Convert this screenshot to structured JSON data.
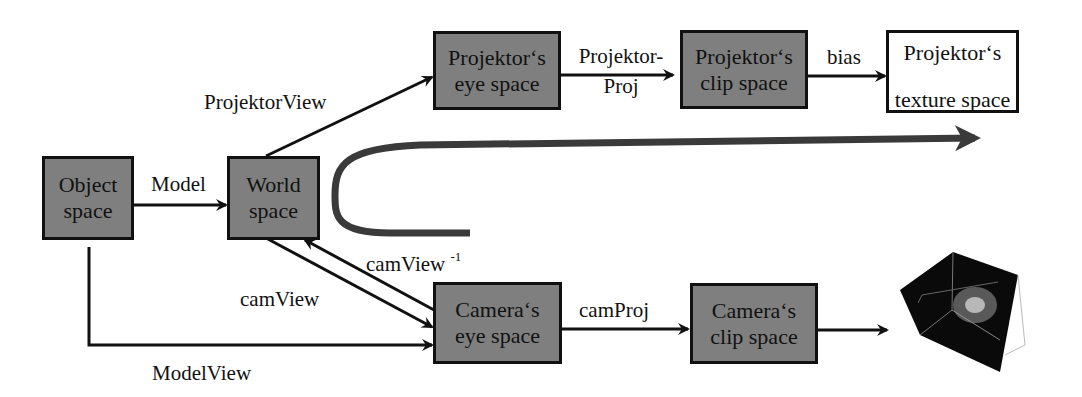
{
  "diagram": {
    "title": "",
    "colors": {
      "box_fill": "#7f7f7f",
      "box_border": "#111111",
      "white_box_fill": "#ffffff",
      "flow_arrow": "#3a3a3a",
      "background": "#ffffff"
    },
    "nodes": {
      "object_space": {
        "line1": "Object",
        "line2": "space"
      },
      "world_space": {
        "line1": "World",
        "line2": "space"
      },
      "projektor_eye": {
        "line1": "Projektor‘s",
        "line2": "eye space"
      },
      "projektor_clip": {
        "line1": "Projektor‘s",
        "line2": "clip space"
      },
      "projektor_texture": {
        "line1": "Projektor‘s",
        "line2": "texture space"
      },
      "camera_eye": {
        "line1": "Camera‘s",
        "line2": "eye space"
      },
      "camera_clip": {
        "line1": "Camera‘s",
        "line2": "clip space"
      }
    },
    "edges": {
      "model": "Model",
      "projektor_view": "ProjektorView",
      "projektor_proj_line1": "Projektor-",
      "projektor_proj_line2": "Proj",
      "bias": "bias",
      "cam_view": "camView",
      "cam_view_inv": "camView",
      "cam_view_inv_sup": "-1",
      "cam_proj": "camProj",
      "model_view": "ModelView"
    },
    "image": {
      "icon": "rendered-cube-thumbnail"
    }
  }
}
